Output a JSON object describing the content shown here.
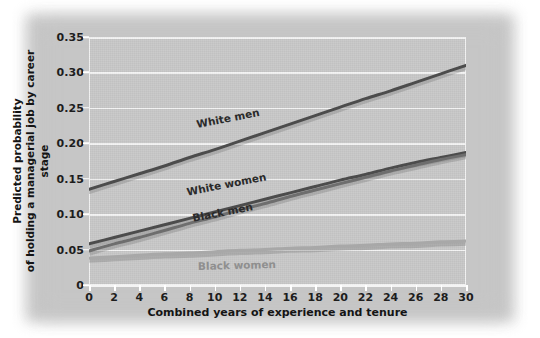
{
  "chart_data": {
    "type": "line",
    "title": "",
    "xlabel": "Combined years of experience and tenure",
    "ylabel": "Predicted probability\nof holding a managerial job by career stage",
    "ylabel_line1": "Predicted probability",
    "ylabel_line2": "of holding a managerial job by career stage",
    "xlim": [
      0,
      30
    ],
    "ylim": [
      0,
      0.35
    ],
    "xticks": [
      0,
      2,
      4,
      6,
      8,
      10,
      12,
      14,
      16,
      18,
      20,
      22,
      24,
      26,
      28,
      30
    ],
    "xtick_labels": [
      "0",
      "2",
      "4",
      "6",
      "8",
      "10",
      "12",
      "14",
      "16",
      "18",
      "20",
      "22",
      "24",
      "26",
      "28",
      "30"
    ],
    "yticks": [
      0,
      0.05,
      0.1,
      0.15,
      0.2,
      0.25,
      0.3,
      0.35
    ],
    "ytick_labels": [
      "0",
      "0.05",
      "0.10",
      "0.15",
      "0.20",
      "0.25",
      "0.30",
      "0.35"
    ],
    "grid": "horizontal",
    "legend_position": "inline-labels",
    "plot_background": "#c9c9c9",
    "gridline_color": "#f4f4f4",
    "x": [
      0,
      2,
      4,
      6,
      8,
      10,
      12,
      14,
      16,
      18,
      20,
      22,
      24,
      26,
      28,
      30
    ],
    "series": [
      {
        "name": "White men",
        "color": "#4c4c4c",
        "label": "White men",
        "values": [
          0.135,
          0.146,
          0.157,
          0.168,
          0.18,
          0.191,
          0.203,
          0.215,
          0.227,
          0.239,
          0.251,
          0.263,
          0.274,
          0.286,
          0.298,
          0.31
        ]
      },
      {
        "name": "White women",
        "color": "#4c4c4c",
        "label": "White women",
        "values": [
          0.058,
          0.067,
          0.076,
          0.085,
          0.094,
          0.103,
          0.112,
          0.121,
          0.13,
          0.139,
          0.148,
          0.156,
          0.165,
          0.173,
          0.18,
          0.187
        ]
      },
      {
        "name": "Black men",
        "color": "#6e6e6e",
        "label": "Black men",
        "values": [
          0.048,
          0.058,
          0.067,
          0.077,
          0.087,
          0.096,
          0.106,
          0.115,
          0.125,
          0.134,
          0.143,
          0.152,
          0.161,
          0.169,
          0.177,
          0.184
        ]
      },
      {
        "name": "Black women",
        "color": "#a8a8a8",
        "label": "Black women",
        "values": [
          0.038,
          0.04,
          0.042,
          0.044,
          0.045,
          0.047,
          0.049,
          0.05,
          0.052,
          0.053,
          0.055,
          0.056,
          0.058,
          0.059,
          0.061,
          0.062
        ]
      }
    ]
  }
}
